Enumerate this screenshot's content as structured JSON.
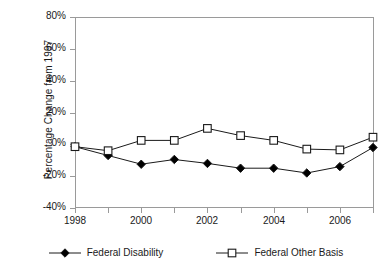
{
  "chart_data": {
    "type": "line",
    "title": "",
    "subtitle": "",
    "xlabel": "",
    "ylabel": "Percentage Change from 1997",
    "x": [
      1998,
      1999,
      2000,
      2001,
      2002,
      2003,
      2004,
      2005,
      2006,
      2007
    ],
    "xlim": [
      1998,
      2007
    ],
    "ylim": [
      -40,
      80
    ],
    "ytick_labels": [
      "80%",
      "60%",
      "40%",
      "20%",
      "0%",
      "-20%",
      "-40%"
    ],
    "ytick_values": [
      80,
      60,
      40,
      20,
      0,
      -20,
      -40
    ],
    "xtick_labels": [
      "1998",
      "",
      "2000",
      "",
      "2002",
      "",
      "2004",
      "",
      "2006",
      ""
    ],
    "xtick_values": [
      1998,
      1999,
      2000,
      2001,
      2002,
      2003,
      2004,
      2005,
      2006,
      2007
    ],
    "grid": false,
    "legend_position": "bottom",
    "series": [
      {
        "name": "Federal Disability",
        "marker": "filled-diamond",
        "color": "#000000",
        "values": [
          -1.5,
          -7,
          -12.5,
          -9.5,
          -12,
          -15,
          -15,
          -18,
          -14,
          -2
        ]
      },
      {
        "name": "Federal Other Basis",
        "marker": "open-square",
        "color": "#000000",
        "values": [
          -1.5,
          -4,
          2.5,
          2.5,
          10,
          5.5,
          2.5,
          -3,
          -3.5,
          4.5
        ]
      }
    ]
  },
  "axes": {
    "y_title": "Percentage Change from 1997",
    "y_ticks": [
      {
        "label": "80%",
        "value": 80
      },
      {
        "label": "60%",
        "value": 60
      },
      {
        "label": "40%",
        "value": 40
      },
      {
        "label": "20%",
        "value": 20
      },
      {
        "label": "0%",
        "value": 0
      },
      {
        "label": "-20%",
        "value": -20
      },
      {
        "label": "-40%",
        "value": -40
      }
    ],
    "x_ticks": [
      {
        "label": "1998",
        "value": 1998
      },
      {
        "label": "",
        "value": 1999
      },
      {
        "label": "2000",
        "value": 2000
      },
      {
        "label": "",
        "value": 2001
      },
      {
        "label": "2002",
        "value": 2002
      },
      {
        "label": "",
        "value": 2003
      },
      {
        "label": "2004",
        "value": 2004
      },
      {
        "label": "",
        "value": 2005
      },
      {
        "label": "2006",
        "value": 2006
      },
      {
        "label": "",
        "value": 2007
      }
    ]
  },
  "legend": {
    "items": [
      {
        "label": "Federal Disability",
        "marker": "filled-diamond"
      },
      {
        "label": "Federal Other Basis",
        "marker": "open-square"
      }
    ]
  },
  "colors": {
    "axis": "#9a9a9a",
    "line": "#1a1a1a",
    "marker_fill_series1": "#000000",
    "marker_fill_series2": "#ffffff",
    "text": "#1a1a1a",
    "background": "#ffffff"
  }
}
